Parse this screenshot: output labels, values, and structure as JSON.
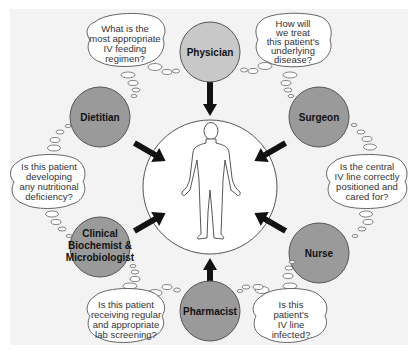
{
  "diagram": {
    "center": {
      "label": "patient-body"
    },
    "colors": {
      "panel": "#f3f3f3",
      "role_fill": "#9a9a9a",
      "physician_fill": "#c8c8c8",
      "arrow": "#111111",
      "bubble_fill": "#ffffff",
      "outline": "#555555"
    },
    "roles": [
      {
        "id": "physician",
        "lines": [
          "Physician"
        ]
      },
      {
        "id": "surgeon",
        "lines": [
          "Surgeon"
        ]
      },
      {
        "id": "nurse",
        "lines": [
          "Nurse"
        ]
      },
      {
        "id": "pharmacist",
        "lines": [
          "Pharmacist"
        ]
      },
      {
        "id": "clinical-biochemist-microbiologist",
        "lines": [
          "Clinical",
          "Biochemist &",
          "Microbiologist"
        ]
      },
      {
        "id": "dietitian",
        "lines": [
          "Dietitian"
        ]
      }
    ],
    "questions": [
      {
        "role": "physician",
        "lines": [
          "What is the",
          "most appropriate",
          "IV feeding",
          "regimen?"
        ]
      },
      {
        "role": "surgeon",
        "lines": [
          "How will",
          "we treat",
          "this patient's",
          "underlying",
          "disease?"
        ]
      },
      {
        "role": "nurse",
        "lines": [
          "Is the central",
          "IV line correctly",
          "positioned and",
          "cared for?"
        ]
      },
      {
        "role": "pharmacist",
        "lines": [
          "Is this",
          "patient's",
          "IV line",
          "infected?"
        ]
      },
      {
        "role": "clinical-biochemist-microbiologist",
        "lines": [
          "Is this patient",
          "receiving regular",
          "and appropriate",
          "lab screening?"
        ]
      },
      {
        "role": "dietitian",
        "lines": [
          "Is this patient",
          "developing",
          "any nutritional",
          "deficiency?"
        ]
      }
    ]
  }
}
